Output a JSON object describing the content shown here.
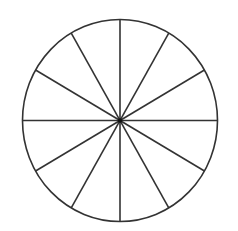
{
  "diagram": {
    "shape": "circle",
    "sectors": 12,
    "center": {
      "x": 120,
      "y": 120.5
    },
    "rx": 97.5,
    "ry": 101,
    "stroke": "#333333",
    "fill": "#ffffff",
    "stroke_width": 1.6
  }
}
